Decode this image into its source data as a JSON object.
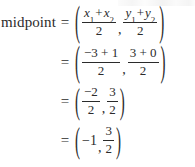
{
  "document": {
    "type": "math-derivation",
    "label": "midpoint",
    "text_color": "#2b2b2b",
    "background_color": "#ffffff"
  },
  "equation": {
    "lhs_label": "midpoint",
    "equals": "=",
    "open_paren": "(",
    "close_paren": ")",
    "comma": ","
  },
  "lines": [
    {
      "id": "line-1",
      "lhs": "midpoint",
      "equals": "=",
      "x_expression": {
        "numerator_parts": [
          "x",
          "1",
          "+",
          "x",
          "2"
        ],
        "numerator_text": "x₁ + x₂",
        "denominator": "2"
      },
      "y_expression": {
        "numerator_parts": [
          "y",
          "1",
          "+",
          "y",
          "2"
        ],
        "numerator_text": "y₁ + y₂",
        "denominator": "2"
      }
    },
    {
      "id": "line-2",
      "lhs": "",
      "equals": "=",
      "x_expression": {
        "numerator_text": "−3 + 1",
        "numerator_first": "−3",
        "numerator_op": "+",
        "numerator_second": "1",
        "denominator": "2"
      },
      "y_expression": {
        "numerator_text": "3 + 0",
        "numerator_first": "3",
        "numerator_op": "+",
        "numerator_second": "0",
        "denominator": "2"
      }
    },
    {
      "id": "line-3",
      "lhs": "",
      "equals": "=",
      "x_expression": {
        "numerator_text": "−2",
        "denominator": "2"
      },
      "y_expression": {
        "numerator_text": "3",
        "denominator": "2"
      }
    },
    {
      "id": "line-4",
      "lhs": "",
      "equals": "=",
      "x_value": "−1",
      "y_expression": {
        "numerator_text": "3",
        "denominator": "2"
      }
    }
  ]
}
